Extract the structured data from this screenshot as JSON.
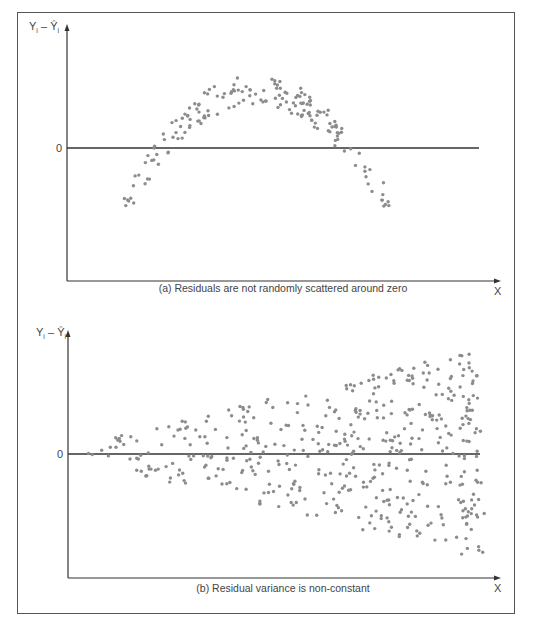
{
  "chart_data": [
    {
      "type": "scatter",
      "id": "a",
      "title": "(a) Residuals are not randomly scattered around zero",
      "xlabel": "X",
      "ylabel": "Y_i − Ŷ_i",
      "ytick_labels": [
        "0"
      ],
      "grid": false,
      "pattern": "inverted-U (parabolic) residuals crossing zero twice",
      "x_range": [
        0,
        1
      ],
      "y_range": [
        -1,
        1
      ],
      "points_description": "Approximately 160 points following an arch: negative at low X, peaking around X≈0.5 with residual ≈ +0.45 of axis height, negative again at high X",
      "curve": {
        "x_start": 0.13,
        "x_end": 0.78,
        "y_min": -0.55,
        "y_peak": 0.45
      }
    },
    {
      "type": "scatter",
      "id": "b",
      "title": "(b) Residual variance is non-constant",
      "xlabel": "X",
      "ylabel": "Y_i − Ŷ_i",
      "ytick_labels": [
        "0"
      ],
      "grid": false,
      "pattern": "funnel shape — spread increases with X (heteroscedasticity)",
      "x_range": [
        0,
        1
      ],
      "y_range": [
        -1,
        1
      ],
      "points_description": "Approximately 450 points centered on zero, spread widening linearly from near 0 at left to about ±0.8 of half-height at X≈0.9",
      "spread": {
        "x_start": 0.0,
        "x_end": 0.87,
        "spread_start": 0.05,
        "spread_end": 0.8
      }
    }
  ],
  "panels": {
    "a": {
      "caption": "(a) Residuals are not randomly scattered around zero",
      "ylabel_main": "Y",
      "ylabel_sub": "i",
      "ylabel_hat": "Ŷ",
      "zero_label": "0",
      "x_label": "X"
    },
    "b": {
      "caption": "(b) Residual variance is non-constant",
      "ylabel_main": "Y",
      "ylabel_sub": "i",
      "ylabel_hat": "Ŷ",
      "zero_label": "0",
      "x_label": "X"
    }
  },
  "colors": {
    "dot": "#8c8c8c",
    "axis": "#333333",
    "frame": "#555555"
  }
}
